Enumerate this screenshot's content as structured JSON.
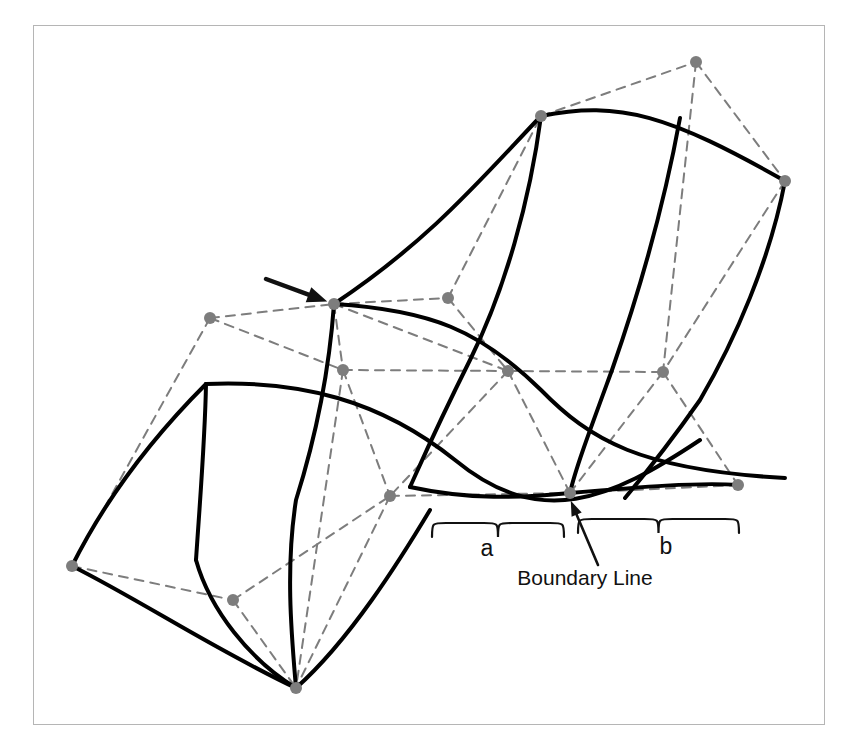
{
  "figure": {
    "type": "bezier-surface-patch-diagram",
    "title": "",
    "background_color": "#ffffff",
    "frame": {
      "border_color": "#b5b5b5",
      "x": 33,
      "y": 25,
      "width": 792,
      "height": 700
    },
    "style": {
      "surface_curve_color": "#000000",
      "surface_curve_width": 4,
      "control_mesh_color": "#7d7d7d",
      "control_mesh_width": 2,
      "control_mesh_dash": "9 7",
      "control_point_color": "#7d7d7d",
      "control_point_radius": 6,
      "annotation_color": "#111111",
      "text_color": "#111111"
    }
  },
  "labels": {
    "span_a": "a",
    "span_b": "b",
    "boundary_line": "Boundary Line"
  },
  "annotations": {
    "pointer_arrow": {
      "name": "control-point-arrow",
      "from": [
        266,
        279
      ],
      "to": [
        331,
        303
      ]
    },
    "boundary_arrow": {
      "name": "boundary-line-arrow",
      "from": [
        598,
        565
      ],
      "to": [
        570,
        499
      ]
    }
  },
  "braces": {
    "a": {
      "x1": 432,
      "x2": 564,
      "y": 523,
      "depth": 14,
      "label_x": 487,
      "label_y": 556
    },
    "b": {
      "x1": 578,
      "x2": 739,
      "y": 519,
      "depth": 14,
      "label_x": 666,
      "label_y": 554
    }
  },
  "text_positions": {
    "boundary_line": {
      "x": 585,
      "y": 585
    }
  },
  "chart_data": {
    "type": "line",
    "xlabel": "",
    "ylabel": "",
    "control_points": [
      {
        "id": "p-left-upper",
        "x": 210,
        "y": 318
      },
      {
        "id": "p-top-vertex",
        "x": 334,
        "y": 304
      },
      {
        "id": "p-top-mid",
        "x": 448,
        "y": 298
      },
      {
        "id": "p-top-apex",
        "x": 696,
        "y": 62
      },
      {
        "id": "p-top-corner",
        "x": 541,
        "y": 116
      },
      {
        "id": "p-right-top",
        "x": 785,
        "y": 181
      },
      {
        "id": "p-mid-left",
        "x": 343,
        "y": 370
      },
      {
        "id": "p-mid-center",
        "x": 508,
        "y": 371
      },
      {
        "id": "p-mid-right",
        "x": 663,
        "y": 372
      },
      {
        "id": "p-low-left",
        "x": 390,
        "y": 496
      },
      {
        "id": "p-boundary",
        "x": 570,
        "y": 493
      },
      {
        "id": "p-low-right",
        "x": 738,
        "y": 485
      },
      {
        "id": "p-bottom-left",
        "x": 72,
        "y": 566
      },
      {
        "id": "p-bottom-mid",
        "x": 233,
        "y": 600
      },
      {
        "id": "p-bottom-apex",
        "x": 296,
        "y": 688
      }
    ],
    "mesh_edges": [
      [
        "p-left-upper",
        "p-top-vertex"
      ],
      [
        "p-top-vertex",
        "p-top-mid"
      ],
      [
        "p-top-mid",
        "p-top-corner"
      ],
      [
        "p-top-corner",
        "p-top-apex"
      ],
      [
        "p-top-apex",
        "p-right-top"
      ],
      [
        "p-left-upper",
        "p-bottom-left"
      ],
      [
        "p-left-upper",
        "p-mid-left"
      ],
      [
        "p-top-vertex",
        "p-mid-left"
      ],
      [
        "p-top-vertex",
        "p-mid-center"
      ],
      [
        "p-top-mid",
        "p-mid-center"
      ],
      [
        "p-mid-left",
        "p-mid-center"
      ],
      [
        "p-mid-center",
        "p-mid-right"
      ],
      [
        "p-top-apex",
        "p-mid-right"
      ],
      [
        "p-right-top",
        "p-mid-right"
      ],
      [
        "p-mid-left",
        "p-low-left"
      ],
      [
        "p-mid-left",
        "p-bottom-apex"
      ],
      [
        "p-mid-center",
        "p-low-left"
      ],
      [
        "p-mid-center",
        "p-boundary"
      ],
      [
        "p-mid-right",
        "p-boundary"
      ],
      [
        "p-mid-right",
        "p-low-right"
      ],
      [
        "p-low-left",
        "p-boundary"
      ],
      [
        "p-boundary",
        "p-low-right"
      ],
      [
        "p-bottom-left",
        "p-bottom-mid"
      ],
      [
        "p-bottom-mid",
        "p-bottom-apex"
      ],
      [
        "p-bottom-mid",
        "p-low-left"
      ],
      [
        "p-low-left",
        "p-bottom-apex"
      ]
    ],
    "surface_curves": [
      {
        "name": "top-boundary-curve",
        "d": "M 541 116 C 620 100 670 116 785 181"
      },
      {
        "name": "upper-left-edge",
        "d": "M 541 116 C 480 180 430 240 334 304"
      },
      {
        "name": "iso-u-1",
        "d": "M 334 304 C 430 310 480 330 541 390 C 590 440 640 470 785 478"
      },
      {
        "name": "iso-u-2",
        "d": "M 206 384 C 300 380 380 400 455 460 C 540 530 610 500 700 440"
      },
      {
        "name": "left-boundary-curve",
        "d": "M 206 384 C 150 440 105 500 72 566"
      },
      {
        "name": "bottom-left-curve",
        "d": "M 72 566 C 140 600 215 650 296 688"
      },
      {
        "name": "iso-v-1",
        "d": "M 334 304 C 330 360 318 430 296 500 C 285 570 292 640 296 688"
      },
      {
        "name": "iso-v-2",
        "d": "M 206 384 C 205 440 200 500 196 560"
      },
      {
        "name": "iso-v-left-lower",
        "d": "M 196 560 C 210 610 250 660 296 688"
      },
      {
        "name": "iso-v-3",
        "d": "M 541 116 C 530 200 505 290 470 360 C 435 430 420 465 410 487"
      },
      {
        "name": "iso-v-4",
        "d": "M 680 118 C 665 200 640 290 612 370 C 590 430 575 470 570 493"
      },
      {
        "name": "iso-v-5",
        "d": "M 785 181 C 770 260 735 340 700 400 C 665 450 640 480 625 498"
      },
      {
        "name": "bottom-right-curve",
        "d": "M 570 493 C 640 487 700 482 738 485"
      },
      {
        "name": "iso-lower-sweep",
        "d": "M 410 487 C 470 500 520 498 570 493"
      },
      {
        "name": "bottom-sweep",
        "d": "M 296 688 C 350 640 400 560 430 510"
      }
    ],
    "legend": [],
    "annotations_text": [
      "a",
      "b",
      "Boundary Line"
    ],
    "grid": false
  }
}
